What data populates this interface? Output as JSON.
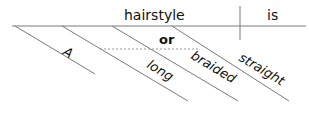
{
  "diagram": {
    "type": "sentence-diagram",
    "sentence": "A long or braided hairstyle is straight",
    "subject": "hairstyle",
    "verb": "is",
    "modifiers": [
      {
        "word": "A",
        "role": "article"
      },
      {
        "word": "long",
        "role": "adjective"
      },
      {
        "word": "braided",
        "role": "adjective"
      },
      {
        "word": "straight",
        "role": "predicate-adjective"
      }
    ],
    "conjunction": "or"
  }
}
